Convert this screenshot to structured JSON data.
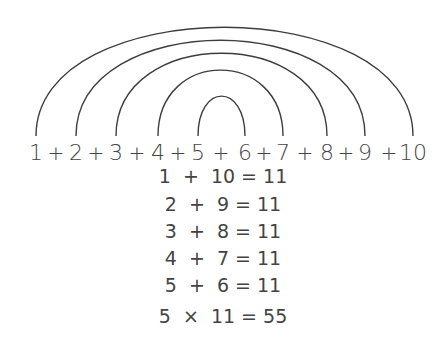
{
  "sequence": {
    "terms": [
      "1",
      "2",
      "3",
      "4",
      "5",
      "6",
      "7",
      "8",
      "9",
      "10"
    ],
    "operator": "+",
    "positions": [
      36,
      76,
      116,
      158,
      198,
      245,
      283,
      327,
      365,
      413
    ],
    "plus_positions": [
      56,
      96,
      137,
      178,
      221,
      264,
      305,
      346,
      389
    ]
  },
  "arcs": [
    {
      "from": "1",
      "to": "10",
      "x1": 36,
      "x2": 413,
      "apex_y": 27
    },
    {
      "from": "2",
      "to": "9",
      "x1": 76,
      "x2": 365,
      "apex_y": 40
    },
    {
      "from": "3",
      "to": "8",
      "x1": 116,
      "x2": 327,
      "apex_y": 53
    },
    {
      "from": "4",
      "to": "7",
      "x1": 158,
      "x2": 283,
      "apex_y": 70
    },
    {
      "from": "5",
      "to": "6",
      "x1": 198,
      "x2": 245,
      "apex_y": 96
    }
  ],
  "arc_baseline_y": 136,
  "stroke_color": "#3d3d3d",
  "equations": [
    {
      "text": "1  +  10 = 11",
      "y": 176
    },
    {
      "text": "2  +  9 = 11",
      "y": 204
    },
    {
      "text": "3  +  8 = 11",
      "y": 231
    },
    {
      "text": "4  +  7 = 11",
      "y": 258
    },
    {
      "text": "5  +  6 = 11",
      "y": 285
    }
  ],
  "result": {
    "text": "5  ×  11 = 55",
    "y": 316
  }
}
